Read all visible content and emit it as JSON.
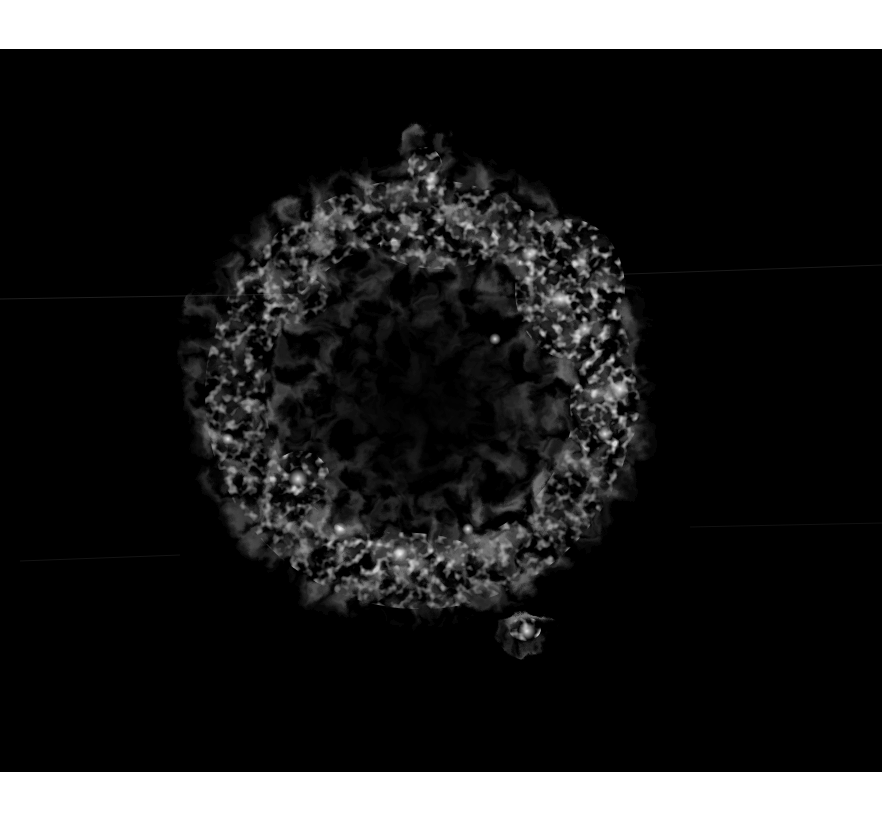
{
  "image": {
    "description": "Grayscale X-ray style image of a roughly circular supernova remnant shell on a black background",
    "subject": "supernova-remnant",
    "colors": {
      "page_background": "#ffffff",
      "frame_background": "#000000",
      "shell_glow": "#8a8a8a",
      "bright_knots": "#e6e6e6",
      "center_void": "#141414"
    },
    "frame": {
      "x": 0,
      "y": 49,
      "width": 882,
      "height": 723
    },
    "remnant": {
      "center_x": 418,
      "center_y": 340,
      "outer_radius": 240,
      "inner_dark_radius": 95,
      "features": [
        {
          "name": "top-protrusion",
          "x": 425,
          "y": 95
        },
        {
          "name": "upper-right-bright-arc",
          "x": 570,
          "y": 230
        },
        {
          "name": "right-bright-region",
          "x": 600,
          "y": 350
        },
        {
          "name": "left-bright-knot",
          "x": 295,
          "y": 430
        },
        {
          "name": "bottom-bright-ring",
          "x": 400,
          "y": 505
        },
        {
          "name": "bottom-right-knot",
          "x": 525,
          "y": 580
        }
      ]
    },
    "artifacts": [
      {
        "name": "streak-left",
        "y": 247
      },
      {
        "name": "streak-right",
        "y": 224
      },
      {
        "name": "streak-lower",
        "y": 508
      }
    ]
  }
}
